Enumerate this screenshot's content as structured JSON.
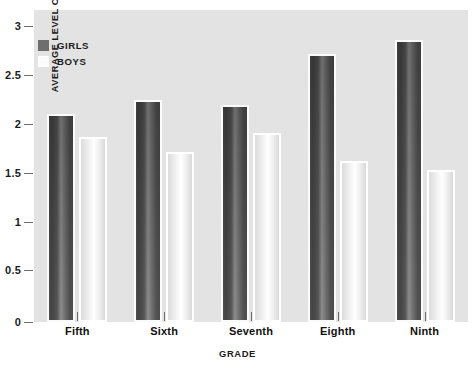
{
  "chart_data": {
    "type": "bar",
    "title": "",
    "xlabel": "GRADE",
    "ylabel": "AVERAGE LEVEL OF CONCERN",
    "categories": [
      "Fifth",
      "Sixth",
      "Seventh",
      "Eighth",
      "Ninth"
    ],
    "series": [
      {
        "name": "GIRLS",
        "values": [
          2.0,
          2.13,
          2.09,
          2.58,
          2.71
        ],
        "color": "#7b7b7b"
      },
      {
        "name": "BOYS",
        "values": [
          1.78,
          1.63,
          1.82,
          1.55,
          1.46
        ],
        "color": "#ffffff"
      }
    ],
    "ylim": [
      0,
      3
    ],
    "yticks": [
      "0",
      "0.5",
      "1",
      "1.5",
      "2",
      "2.5",
      "3"
    ],
    "ytick_values": [
      0,
      0.5,
      1,
      1.5,
      2,
      2.5,
      3
    ],
    "grid": false,
    "legend_position": "top-left",
    "plot_background": "#e3e3e3"
  },
  "legend": {
    "items": [
      {
        "label": "GIRLS",
        "swatch": "girls"
      },
      {
        "label": "BOYS",
        "swatch": "boys"
      }
    ]
  }
}
